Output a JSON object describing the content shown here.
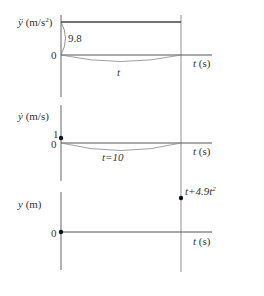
{
  "diagram": {
    "panels": [
      {
        "id": "acceleration",
        "ylabel_var": "ÿ",
        "ylabel_unit": "(m/s",
        "ylabel_unit_sup": "2",
        "ylabel_unit_close": ")",
        "zero_label": "0",
        "value_label": "9.8",
        "curve_label": "t",
        "xlabel_var": "t",
        "xlabel_unit": "(s)"
      },
      {
        "id": "velocity",
        "ylabel_var": "ẏ",
        "ylabel_unit": "(m/s)",
        "one_label": "1",
        "zero_label": "0",
        "curve_label": "t=10",
        "xlabel_var": "t",
        "xlabel_unit": "(s)"
      },
      {
        "id": "position",
        "ylabel_var": "y",
        "ylabel_unit": "(m)",
        "zero_label": "0",
        "point_label": "t+4.9t",
        "point_label_sup": "2",
        "xlabel_var": "t",
        "xlabel_unit": "(s)"
      }
    ],
    "colors": {
      "line": "#555555",
      "thin": "#888888",
      "point": "#111111"
    }
  }
}
